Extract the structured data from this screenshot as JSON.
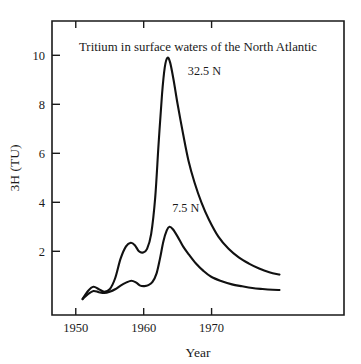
{
  "chart_data": {
    "type": "line",
    "title": "Tritium in surface waters of the North Atlantic",
    "xlabel": "Year",
    "ylabel": "3H (TU)",
    "xlim": [
      1946.5,
      1989.5
    ],
    "ylim": [
      -0.6,
      11.4
    ],
    "xticks": [
      1950,
      1960,
      1970
    ],
    "xticklabels": [
      "1950",
      "1960",
      "1970"
    ],
    "yticks": [
      2,
      4,
      6,
      8,
      10
    ],
    "yticklabels": [
      "2",
      "4",
      "6",
      "8",
      "10"
    ],
    "grid": false,
    "legend": "inline annotations",
    "frame": "box",
    "tick_direction": "in",
    "line_color": "#111111",
    "background_color": "#ffffff",
    "series": [
      {
        "name": "32.5 N",
        "label": "32.5 N",
        "label_x": 1966.5,
        "label_y": 9.2,
        "peak_year": 1963.5,
        "peak_value": 9.9,
        "x": [
          1951.0,
          1951.8,
          1952.6,
          1953.4,
          1954.2,
          1955.0,
          1955.8,
          1956.6,
          1957.4,
          1958.1,
          1958.7,
          1959.3,
          1959.9,
          1960.5,
          1961.1,
          1961.7,
          1962.2,
          1962.7,
          1963.1,
          1963.5,
          1963.9,
          1964.4,
          1965.0,
          1965.8,
          1966.6,
          1967.5,
          1968.5,
          1969.6,
          1971.0,
          1972.5,
          1974.0,
          1975.5,
          1977.0,
          1978.5,
          1980.0
        ],
        "y": [
          0.05,
          0.38,
          0.55,
          0.45,
          0.35,
          0.45,
          0.9,
          1.7,
          2.2,
          2.35,
          2.25,
          2.0,
          1.95,
          2.1,
          2.7,
          4.2,
          6.4,
          8.4,
          9.5,
          9.9,
          9.7,
          9.0,
          8.0,
          6.8,
          5.7,
          4.8,
          4.0,
          3.3,
          2.6,
          2.1,
          1.75,
          1.5,
          1.3,
          1.15,
          1.05
        ]
      },
      {
        "name": "7.5 N",
        "label": "7.5 N",
        "label_x": 1964.2,
        "label_y": 3.6,
        "peak_year": 1963.8,
        "peak_value": 3.0,
        "x": [
          1951.0,
          1951.8,
          1952.6,
          1953.4,
          1954.2,
          1955.0,
          1955.8,
          1956.6,
          1957.4,
          1958.2,
          1958.9,
          1959.5,
          1960.1,
          1960.7,
          1961.3,
          1961.9,
          1962.4,
          1962.9,
          1963.4,
          1963.8,
          1964.3,
          1965.0,
          1965.8,
          1966.7,
          1967.7,
          1968.8,
          1970.0,
          1971.5,
          1973.0,
          1974.5,
          1976.0,
          1977.5,
          1979.0,
          1980.0
        ],
        "y": [
          0.05,
          0.25,
          0.38,
          0.33,
          0.3,
          0.35,
          0.45,
          0.6,
          0.72,
          0.8,
          0.72,
          0.6,
          0.58,
          0.62,
          0.75,
          1.1,
          1.7,
          2.4,
          2.85,
          3.0,
          2.9,
          2.6,
          2.2,
          1.85,
          1.5,
          1.2,
          0.95,
          0.78,
          0.65,
          0.57,
          0.5,
          0.46,
          0.43,
          0.42
        ]
      }
    ]
  }
}
